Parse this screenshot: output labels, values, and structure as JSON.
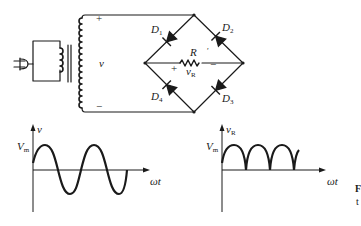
{
  "figure": {
    "colors": {
      "ink": "#1a1a1a",
      "background": "#ffffff"
    }
  },
  "circuit": {
    "source_label": "v",
    "source_plus": "+",
    "source_minus": "−",
    "diodes": [
      {
        "name": "D",
        "index": "1"
      },
      {
        "name": "D",
        "index": "2"
      },
      {
        "name": "D",
        "index": "3"
      },
      {
        "name": "D",
        "index": "4"
      }
    ],
    "resistor_label": "R",
    "resistor_tick": "′",
    "load_voltage": {
      "name": "v",
      "sub": "R"
    },
    "load_plus": "+",
    "load_minus": "−"
  },
  "graphs": {
    "input": {
      "y_label": "v",
      "peak_label": {
        "name": "V",
        "sub": "m"
      },
      "x_label": "ωt",
      "waveform": "sine"
    },
    "output": {
      "y_label": {
        "name": "v",
        "sub": "R"
      },
      "peak_label": {
        "name": "V",
        "sub": "m"
      },
      "x_label": "ωt",
      "waveform": "full-wave rectified sine"
    }
  },
  "caption": {
    "line1": "F",
    "line2": "t"
  }
}
